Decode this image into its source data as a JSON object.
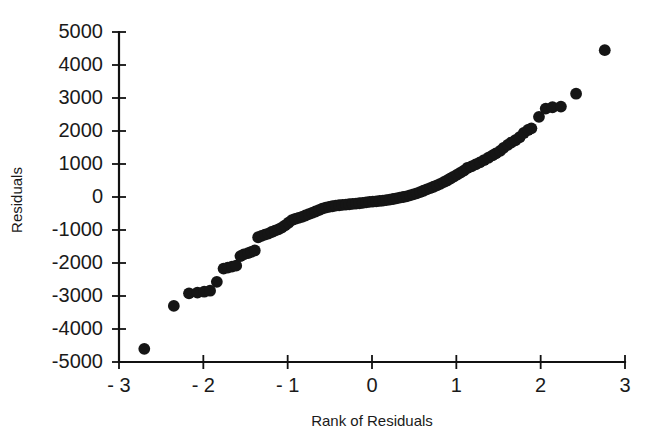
{
  "chart_data": {
    "type": "scatter",
    "title": "",
    "xlabel": "Rank of Residuals",
    "ylabel": "Residuals",
    "xlim": [
      -3,
      3
    ],
    "ylim": [
      -5000,
      5000
    ],
    "grid": false,
    "legend": null,
    "xticks": [
      -3,
      -2,
      -1,
      0,
      1,
      2,
      3
    ],
    "xtick_labels": [
      "- 3",
      "- 2",
      "- 1",
      "0",
      "1",
      "2",
      "3"
    ],
    "yticks": [
      -5000,
      -4000,
      -3000,
      -2000,
      -1000,
      0,
      1000,
      2000,
      3000,
      4000,
      5000
    ],
    "ytick_labels": [
      "-5000",
      "-4000",
      "-3000",
      "-2000",
      "-1000",
      "0",
      "1000",
      "2000",
      "3000",
      "4000",
      "5000"
    ],
    "marker": "filled-circle",
    "marker_color": "#151515",
    "marker_size": 7,
    "series": [
      {
        "name": "Residuals",
        "points": [
          [
            -2.7,
            -4600
          ],
          [
            -2.35,
            -3300
          ],
          [
            -2.17,
            -2920
          ],
          [
            -2.07,
            -2900
          ],
          [
            -1.99,
            -2870
          ],
          [
            -1.92,
            -2840
          ],
          [
            -1.84,
            -2570
          ],
          [
            -1.76,
            -2170
          ],
          [
            -1.71,
            -2140
          ],
          [
            -1.66,
            -2110
          ],
          [
            -1.61,
            -2080
          ],
          [
            -1.56,
            -1790
          ],
          [
            -1.52,
            -1740
          ],
          [
            -1.47,
            -1700
          ],
          [
            -1.43,
            -1660
          ],
          [
            -1.39,
            -1620
          ],
          [
            -1.35,
            -1220
          ],
          [
            -1.31,
            -1180
          ],
          [
            -1.27,
            -1140
          ],
          [
            -1.23,
            -1110
          ],
          [
            -1.19,
            -1060
          ],
          [
            -1.15,
            -1020
          ],
          [
            -1.11,
            -980
          ],
          [
            -1.07,
            -930
          ],
          [
            -1.03,
            -860
          ],
          [
            -0.99,
            -780
          ],
          [
            -0.95,
            -700
          ],
          [
            -0.91,
            -660
          ],
          [
            -0.87,
            -630
          ],
          [
            -0.83,
            -600
          ],
          [
            -0.79,
            -560
          ],
          [
            -0.75,
            -520
          ],
          [
            -0.71,
            -480
          ],
          [
            -0.67,
            -440
          ],
          [
            -0.63,
            -400
          ],
          [
            -0.59,
            -350
          ],
          [
            -0.55,
            -320
          ],
          [
            -0.51,
            -300
          ],
          [
            -0.47,
            -280
          ],
          [
            -0.43,
            -260
          ],
          [
            -0.39,
            -250
          ],
          [
            -0.35,
            -240
          ],
          [
            -0.31,
            -230
          ],
          [
            -0.27,
            -220
          ],
          [
            -0.23,
            -210
          ],
          [
            -0.19,
            -200
          ],
          [
            -0.15,
            -190
          ],
          [
            -0.11,
            -175
          ],
          [
            -0.07,
            -160
          ],
          [
            -0.03,
            -150
          ],
          [
            0.01,
            -140
          ],
          [
            0.05,
            -130
          ],
          [
            0.09,
            -120
          ],
          [
            0.13,
            -110
          ],
          [
            0.17,
            -95
          ],
          [
            0.21,
            -80
          ],
          [
            0.25,
            -60
          ],
          [
            0.29,
            -40
          ],
          [
            0.33,
            -20
          ],
          [
            0.37,
            0
          ],
          [
            0.41,
            20
          ],
          [
            0.45,
            50
          ],
          [
            0.49,
            80
          ],
          [
            0.53,
            110
          ],
          [
            0.57,
            150
          ],
          [
            0.61,
            190
          ],
          [
            0.65,
            230
          ],
          [
            0.69,
            270
          ],
          [
            0.73,
            310
          ],
          [
            0.77,
            350
          ],
          [
            0.81,
            400
          ],
          [
            0.85,
            450
          ],
          [
            0.89,
            500
          ],
          [
            0.93,
            560
          ],
          [
            0.97,
            620
          ],
          [
            1.01,
            680
          ],
          [
            1.05,
            740
          ],
          [
            1.09,
            800
          ],
          [
            1.13,
            880
          ],
          [
            1.18,
            930
          ],
          [
            1.23,
            990
          ],
          [
            1.28,
            1050
          ],
          [
            1.33,
            1120
          ],
          [
            1.38,
            1190
          ],
          [
            1.43,
            1260
          ],
          [
            1.47,
            1320
          ],
          [
            1.52,
            1400
          ],
          [
            1.56,
            1490
          ],
          [
            1.61,
            1580
          ],
          [
            1.65,
            1650
          ],
          [
            1.7,
            1720
          ],
          [
            1.75,
            1810
          ],
          [
            1.8,
            1940
          ],
          [
            1.85,
            2030
          ],
          [
            1.89,
            2080
          ],
          [
            1.98,
            2430
          ],
          [
            2.06,
            2680
          ],
          [
            2.14,
            2720
          ],
          [
            2.24,
            2740
          ],
          [
            2.42,
            3130
          ],
          [
            2.76,
            4450
          ]
        ]
      }
    ]
  },
  "figure": {
    "background_color": "#ffffff",
    "axis_color": "#111111",
    "text_color": "#1a1a1a"
  }
}
